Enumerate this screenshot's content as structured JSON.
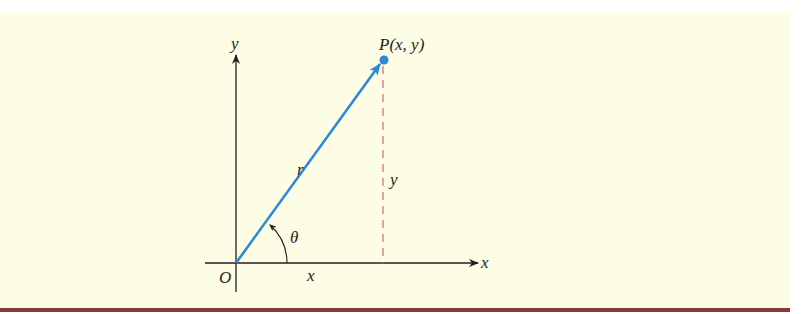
{
  "figure": {
    "point_label": "P(x, y)",
    "radius_label": "r",
    "angle_label": "θ",
    "origin_label": "O",
    "x_axis_label": "x",
    "y_axis_label": "y",
    "x_segment_label": "x",
    "y_segment_label": "y",
    "colors": {
      "background": "#fdfde6",
      "vector": "#2b8ad6",
      "point": "#2b8ad6",
      "dashed_line": "#d9646e",
      "axes": "#231f20",
      "bottom_rule": "#8a3a34"
    }
  }
}
